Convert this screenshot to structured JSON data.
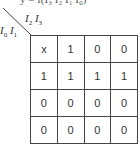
{
  "header_fragment": "y = f(I₃ I₂ I₁ I₀)",
  "labels": {
    "col_vars": {
      "a": "I",
      "a_sub": "2",
      "b": "I",
      "b_sub": "3"
    },
    "row_vars": {
      "a": "I",
      "a_sub": "0",
      "b": "I",
      "b_sub": "1"
    }
  },
  "kmap": {
    "rows": [
      [
        "x",
        "1",
        "0",
        "0"
      ],
      [
        "1",
        "1",
        "1",
        "1"
      ],
      [
        "0",
        "0",
        "0",
        "0"
      ],
      [
        "0",
        "0",
        "0",
        "0"
      ]
    ]
  }
}
